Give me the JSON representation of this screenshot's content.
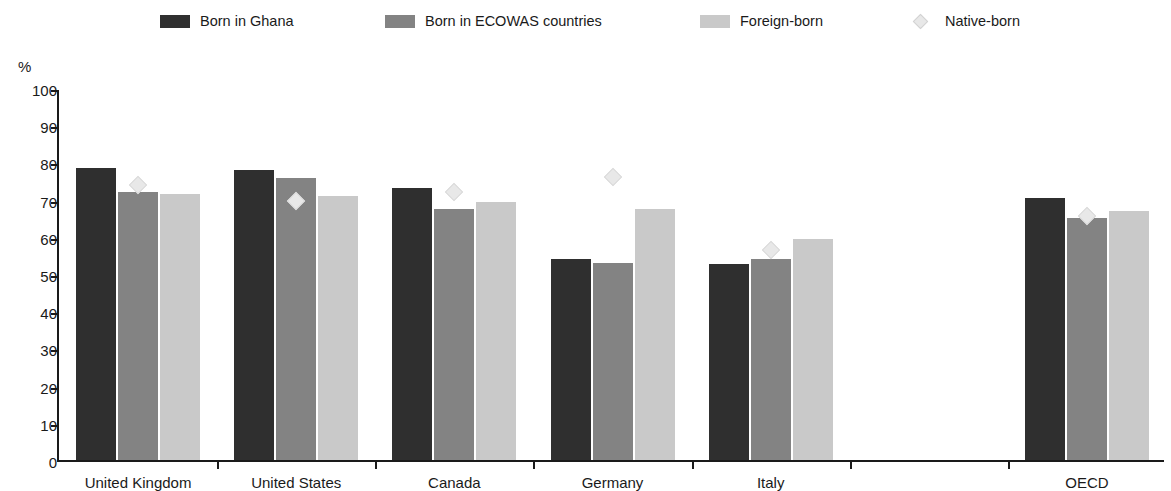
{
  "legend": {
    "entries": [
      {
        "label": "Born in Ghana",
        "marker": "swatch-dark",
        "color": "#2f2f2f",
        "x": 160
      },
      {
        "label": "Born in ECOWAS countries",
        "marker": "swatch-medium",
        "color": "#838383",
        "x": 385
      },
      {
        "label": "Foreign-born",
        "marker": "swatch-light",
        "color": "#c9c9c9",
        "x": 700
      },
      {
        "label": "Native-born",
        "marker": "diamond",
        "color": "#e8e8e8",
        "x": 905
      }
    ]
  },
  "axis": {
    "y_unit": "%",
    "y_ticks": [
      "100",
      "90",
      "80",
      "70",
      "60",
      "50",
      "40",
      "30",
      "20",
      "10",
      "0"
    ]
  },
  "chart_data": {
    "type": "bar",
    "title": "",
    "xlabel": "",
    "ylabel": "%",
    "ylim": [
      0,
      100
    ],
    "ytick_step": 10,
    "grid": false,
    "legend_position": "top",
    "categories": [
      "United Kingdom",
      "United States",
      "Canada",
      "Germany",
      "Italy",
      "OECD"
    ],
    "series": [
      {
        "name": "Born in Ghana",
        "type": "bar",
        "color": "#2f2f2f",
        "values": [
          78.5,
          78.0,
          73.0,
          54.0,
          52.8,
          70.3
        ]
      },
      {
        "name": "Born in ECOWAS countries",
        "type": "bar",
        "color": "#838383",
        "values": [
          72.0,
          75.8,
          67.5,
          53.0,
          54.0,
          65.0
        ]
      },
      {
        "name": "Foreign-born",
        "type": "bar",
        "color": "#c9c9c9",
        "values": [
          71.5,
          71.0,
          69.3,
          67.5,
          59.3,
          67.0
        ]
      },
      {
        "name": "Native-born",
        "type": "marker",
        "color": "#e8e8e8",
        "values": [
          74.0,
          69.5,
          72.0,
          76.0,
          56.5,
          65.5
        ]
      }
    ]
  }
}
